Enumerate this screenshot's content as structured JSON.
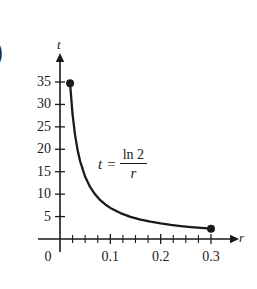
{
  "figure": {
    "part_label": ")",
    "background": "#ffffff",
    "ink_color": "#1a1a1a"
  },
  "chart_data": {
    "type": "line",
    "title": "",
    "xlabel": "r",
    "ylabel": "t",
    "annotation": {
      "lhs": "t",
      "equals": "=",
      "numerator": "ln 2",
      "denominator": "r"
    },
    "xlim": [
      0,
      0.33
    ],
    "ylim": [
      0,
      38
    ],
    "grid": false,
    "legend": null,
    "x_ticks_major": [
      0,
      0.1,
      0.2,
      0.3
    ],
    "x_tick_labels": [
      "0",
      "0.1",
      "0.2",
      "0.3"
    ],
    "x_ticks_minor": [
      0.025,
      0.05,
      0.075,
      0.125,
      0.15,
      0.175,
      0.225,
      0.25,
      0.275
    ],
    "y_ticks": [
      5,
      10,
      15,
      20,
      25,
      30,
      35
    ],
    "y_tick_labels": [
      "5",
      "10",
      "15",
      "20",
      "25",
      "30",
      "35"
    ],
    "series": [
      {
        "name": "t = ln2 / r",
        "endpoint_markers": [
          {
            "x": 0.02,
            "y": 34.7
          },
          {
            "x": 0.3,
            "y": 2.31
          }
        ],
        "x": [
          0.02,
          0.025,
          0.03,
          0.035,
          0.04,
          0.05,
          0.06,
          0.07,
          0.08,
          0.09,
          0.1,
          0.12,
          0.14,
          0.16,
          0.18,
          0.2,
          0.22,
          0.24,
          0.26,
          0.28,
          0.3
        ],
        "y": [
          34.66,
          27.73,
          23.1,
          19.8,
          17.33,
          13.86,
          11.55,
          9.9,
          8.66,
          7.7,
          6.93,
          5.78,
          4.95,
          4.33,
          3.85,
          3.47,
          3.15,
          2.89,
          2.67,
          2.48,
          2.31
        ]
      }
    ]
  }
}
